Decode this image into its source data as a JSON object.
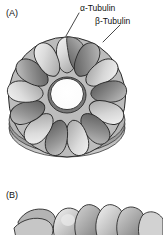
{
  "figure": {
    "background_color": "#ffffff",
    "width": 163,
    "height": 235,
    "style": "grayscale scientific illustration"
  },
  "panels": [
    {
      "id": "A",
      "label": "(A)",
      "view": "top view of tubulin ring (gamma-tubulin ring complex / microtubule cross-section)",
      "subunit_count": 13,
      "center_hole": {
        "cx": 67,
        "cy": 95,
        "r": 16,
        "color": "#ffffff"
      }
    },
    {
      "id": "B",
      "label": "(B)",
      "view": "side view of stacked tubulin protofilament lobes",
      "cropped": true
    }
  ],
  "callouts": [
    {
      "id": "alpha",
      "text": "α-Tubulin",
      "points_to": "top light subunit"
    },
    {
      "id": "beta",
      "text": "β-Tubulin",
      "points_to": "upper-right dark subunit"
    }
  ],
  "colors": {
    "subunit_light_high": "#f2f2f2",
    "subunit_light_low": "#b8b8b8",
    "subunit_dark_high": "#c9c9c9",
    "subunit_dark_low": "#6f6f6f",
    "outline": "#2b2b2b",
    "text": "#111111",
    "leader_line": "#333333"
  }
}
